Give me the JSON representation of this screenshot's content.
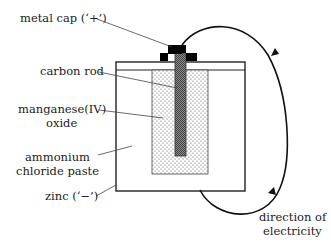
{
  "diagram": {
    "labels": {
      "metal_cap": "metal cap (‘+’)",
      "carbon_rod": "carbon rod",
      "manganese_line1": "manganese(IV)",
      "manganese_line2": "oxide",
      "ammonium_line1": "ammonium",
      "ammonium_line2": "chloride paste",
      "zinc": "zinc (‘−’)",
      "direction_line1": "direction of",
      "direction_line2": "electricity"
    },
    "colors": {
      "cap": "#000000",
      "rod": "#6a6a6a",
      "paste_dots": "#555555",
      "outline": "#222222"
    }
  }
}
